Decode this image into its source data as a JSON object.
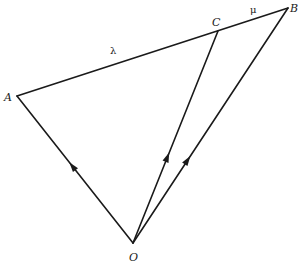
{
  "diagram": {
    "type": "vector-triangle",
    "points": {
      "A": {
        "label": "A",
        "x": 17,
        "y": 96
      },
      "B": {
        "label": "B",
        "x": 288,
        "y": 8
      },
      "C": {
        "label": "C",
        "x": 218,
        "y": 31
      },
      "O": {
        "label": "O",
        "x": 133,
        "y": 243
      }
    },
    "segments": [
      {
        "from": "A",
        "to": "B",
        "arrow": false
      },
      {
        "from": "O",
        "to": "A",
        "arrow": true
      },
      {
        "from": "O",
        "to": "C",
        "arrow": true
      },
      {
        "from": "O",
        "to": "B",
        "arrow": true
      }
    ],
    "ratio_labels": {
      "lambda": "λ",
      "mu": "μ"
    }
  }
}
